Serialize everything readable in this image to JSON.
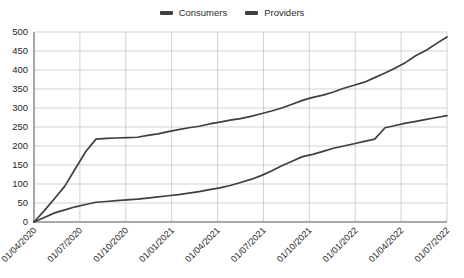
{
  "chart_data": {
    "type": "line",
    "title": "",
    "subtitle": "",
    "xlabel": "",
    "ylabel": "",
    "ylim": [
      0,
      500
    ],
    "ytick_step": 50,
    "ytick_labels": [
      "0",
      "50",
      "100",
      "150",
      "200",
      "250",
      "300",
      "350",
      "400",
      "450",
      "500"
    ],
    "grid": true,
    "legend_position": "top-center",
    "x_tick_labels": [
      "01/04/2020",
      "01/07/2020",
      "01/10/2020",
      "01/01/2021",
      "01/04/2021",
      "01/07/2021",
      "01/10/2021",
      "01/01/2022",
      "01/04/2022",
      "01/07/2022"
    ],
    "x_tick_rotation_deg": -45,
    "series": [
      {
        "name": "Consumers",
        "color": "#3f3f3f",
        "x": [
          "01/04/2020",
          "15/04/2020",
          "01/05/2020",
          "15/05/2020",
          "01/06/2020",
          "15/06/2020",
          "01/07/2020",
          "15/07/2020",
          "01/08/2020",
          "01/09/2020",
          "01/10/2020",
          "15/10/2020",
          "01/11/2020",
          "01/12/2020",
          "01/01/2021",
          "15/01/2021",
          "01/02/2021",
          "01/03/2021",
          "01/04/2021",
          "15/04/2021",
          "01/05/2021",
          "01/06/2021",
          "01/07/2021",
          "15/07/2021",
          "01/08/2021",
          "01/09/2021",
          "01/10/2021",
          "15/10/2021",
          "01/11/2021",
          "01/12/2021",
          "01/01/2022",
          "15/01/2022",
          "01/02/2022",
          "01/03/2022",
          "01/04/2022",
          "15/04/2022",
          "01/05/2022",
          "15/05/2022",
          "01/06/2022",
          "15/06/2022",
          "01/07/2022"
        ],
        "values": [
          0,
          30,
          62,
          95,
          140,
          185,
          218,
          220,
          221,
          222,
          223,
          228,
          232,
          238,
          243,
          248,
          252,
          258,
          263,
          268,
          272,
          278,
          285,
          292,
          300,
          310,
          320,
          328,
          334,
          342,
          352,
          360,
          368,
          380,
          392,
          405,
          420,
          438,
          452,
          470,
          487
        ]
      },
      {
        "name": "Providers",
        "color": "#3f3f3f",
        "x": [
          "01/04/2020",
          "15/04/2020",
          "01/05/2020",
          "15/05/2020",
          "01/06/2020",
          "15/06/2020",
          "01/07/2020",
          "15/07/2020",
          "01/08/2020",
          "01/09/2020",
          "01/10/2020",
          "15/10/2020",
          "01/11/2020",
          "01/12/2020",
          "01/01/2021",
          "15/01/2021",
          "01/02/2021",
          "01/03/2021",
          "01/04/2021",
          "15/04/2021",
          "01/05/2021",
          "01/06/2021",
          "01/07/2021",
          "15/07/2021",
          "01/08/2021",
          "01/09/2021",
          "01/10/2021",
          "15/10/2021",
          "01/11/2021",
          "01/12/2021",
          "01/01/2022",
          "15/01/2022",
          "01/02/2022",
          "01/03/2022",
          "01/04/2022",
          "15/04/2022",
          "01/05/2022",
          "15/05/2022",
          "01/06/2022",
          "15/06/2022",
          "01/07/2022"
        ],
        "values": [
          0,
          12,
          24,
          32,
          40,
          46,
          52,
          54,
          56,
          58,
          60,
          63,
          66,
          69,
          72,
          76,
          80,
          85,
          90,
          96,
          104,
          112,
          122,
          134,
          148,
          160,
          172,
          178,
          186,
          194,
          200,
          206,
          212,
          218,
          248,
          254,
          260,
          265,
          270,
          275,
          280
        ]
      }
    ]
  },
  "legend": {
    "items": [
      {
        "label": "Consumers",
        "color": "#3f3f3f"
      },
      {
        "label": "Providers",
        "color": "#3f3f3f"
      }
    ]
  },
  "axes": {
    "grid_color": "#b9bec6",
    "axis_color": "#6b6b6b",
    "tick_text_color": "#1e1e1e"
  }
}
